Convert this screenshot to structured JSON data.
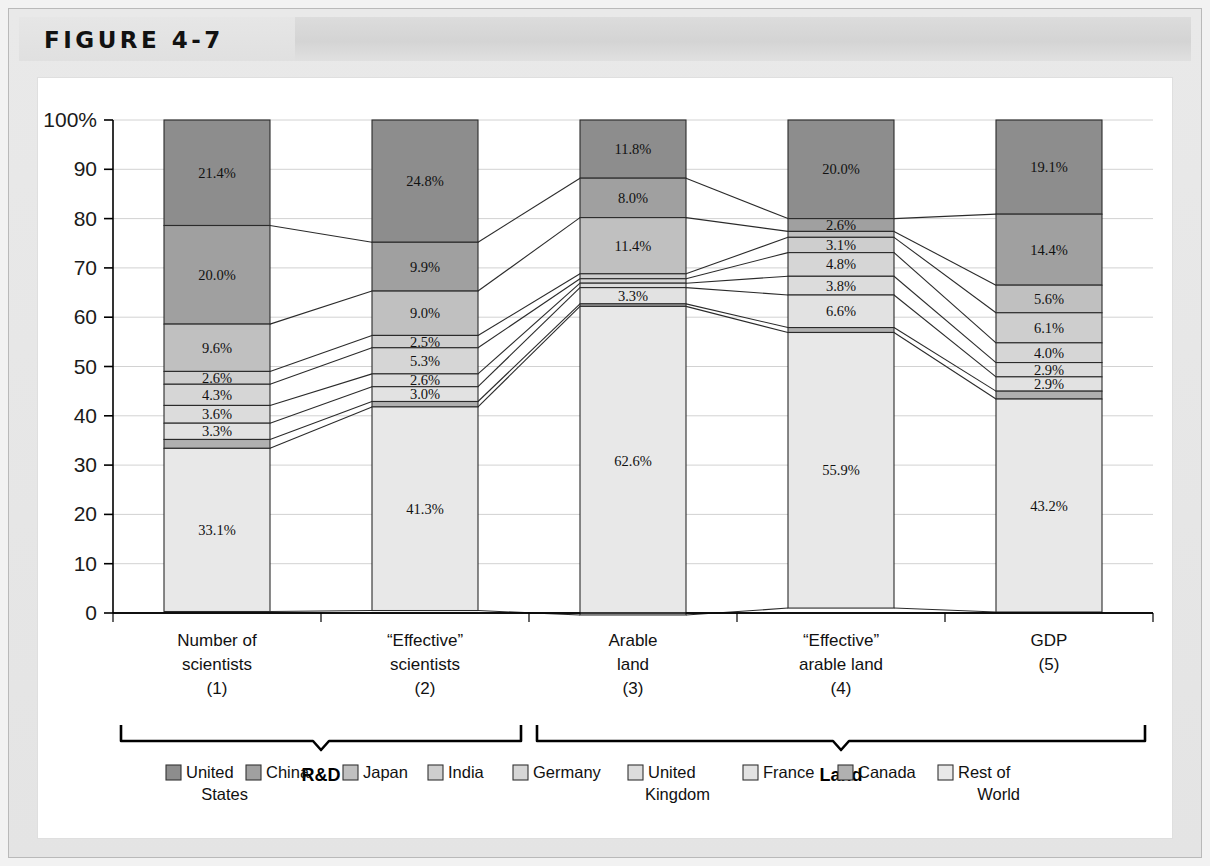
{
  "figure": {
    "label": "FIGURE 4-7"
  },
  "chart_data": {
    "type": "bar",
    "stacked": true,
    "title": "",
    "xlabel": "",
    "ylabel": "",
    "ylim": [
      0,
      100
    ],
    "grid": true,
    "legend_position": "bottom",
    "y_ticks": [
      "100%",
      "90",
      "80",
      "70",
      "60",
      "50",
      "40",
      "30",
      "20",
      "10",
      "0"
    ],
    "y_tick_values": [
      100,
      90,
      80,
      70,
      60,
      50,
      40,
      30,
      20,
      10,
      0
    ],
    "categories": [
      "Number of scientists (1)",
      "“Effective” scientists (2)",
      "Arable land (3)",
      "“Effective” arable land (4)",
      "GDP (5)"
    ],
    "category_lines": [
      [
        "Number of",
        "scientists",
        "(1)"
      ],
      [
        "“Effective”",
        "scientists",
        "(2)"
      ],
      [
        "Arable",
        "land",
        "(3)"
      ],
      [
        "“Effective”",
        "arable land",
        "(4)"
      ],
      [
        "GDP",
        "(5)"
      ]
    ],
    "groups": [
      {
        "label": "R&D",
        "categories": [
          0,
          1
        ]
      },
      {
        "label": "Land",
        "categories": [
          2,
          3,
          4
        ]
      }
    ],
    "series": [
      {
        "name": "United States",
        "color": "#8d8d8d",
        "values": [
          21.4,
          24.8,
          11.8,
          20.0,
          19.1
        ],
        "labels": [
          "21.4%",
          "24.8%",
          "11.8%",
          "20.0%",
          "19.1%"
        ]
      },
      {
        "name": "China",
        "color": "#a0a0a0",
        "values": [
          20.0,
          9.9,
          8.0,
          2.6,
          14.4
        ],
        "labels": [
          "20.0%",
          "9.9%",
          "8.0%",
          "2.6%",
          "14.4%"
        ]
      },
      {
        "name": "Japan",
        "color": "#c0c0c0",
        "values": [
          9.6,
          9.0,
          11.4,
          1.2,
          5.6
        ],
        "labels": [
          "9.6%",
          "9.0%",
          "11.4%",
          "",
          "5.6%"
        ]
      },
      {
        "name": "India",
        "color": "#cecece",
        "values": [
          2.6,
          2.5,
          1.0,
          3.1,
          6.1
        ],
        "labels": [
          "2.6%",
          "2.5%",
          "",
          "3.1%",
          "6.1%"
        ]
      },
      {
        "name": "Germany",
        "color": "#d6d6d6",
        "values": [
          4.3,
          5.3,
          0.9,
          4.8,
          4.0
        ],
        "labels": [
          "4.3%",
          "5.3%",
          "",
          "4.8%",
          "4.0%"
        ]
      },
      {
        "name": "United Kingdom",
        "color": "#dcdcdc",
        "values": [
          3.6,
          2.6,
          0.9,
          3.8,
          2.9
        ],
        "labels": [
          "3.6%",
          "2.6%",
          "",
          "3.8%",
          "2.9%"
        ]
      },
      {
        "name": "France",
        "color": "#e2e2e2",
        "values": [
          3.3,
          3.0,
          3.3,
          6.6,
          2.9
        ],
        "labels": [
          "3.3%",
          "3.0%",
          "3.3%",
          "6.6%",
          "2.9%"
        ]
      },
      {
        "name": "Canada",
        "color": "#b0b0b0",
        "values": [
          1.8,
          1.1,
          0.5,
          1.0,
          1.6
        ],
        "labels": [
          "",
          "",
          "",
          "",
          ""
        ]
      },
      {
        "name": "Rest of World",
        "color": "#e8e8e8",
        "values": [
          33.1,
          41.3,
          62.6,
          55.9,
          43.2
        ],
        "labels": [
          "33.1%",
          "41.3%",
          "62.6%",
          "55.9%",
          "43.2%"
        ]
      }
    ],
    "legend": [
      {
        "name": "United States",
        "lines": [
          "United",
          "States"
        ],
        "color": "#8d8d8d"
      },
      {
        "name": "China",
        "lines": [
          "China"
        ],
        "color": "#a0a0a0"
      },
      {
        "name": "Japan",
        "lines": [
          "Japan"
        ],
        "color": "#c0c0c0"
      },
      {
        "name": "India",
        "lines": [
          "India"
        ],
        "color": "#cecece"
      },
      {
        "name": "Germany",
        "lines": [
          "Germany"
        ],
        "color": "#d6d6d6"
      },
      {
        "name": "United Kingdom",
        "lines": [
          "United",
          "Kingdom"
        ],
        "color": "#dcdcdc"
      },
      {
        "name": "France",
        "lines": [
          "France"
        ],
        "color": "#e2e2e2"
      },
      {
        "name": "Canada",
        "lines": [
          "Canada"
        ],
        "color": "#b0b0b0"
      },
      {
        "name": "Rest of World",
        "lines": [
          "Rest of",
          "World"
        ],
        "color": "#e8e8e8"
      }
    ]
  }
}
